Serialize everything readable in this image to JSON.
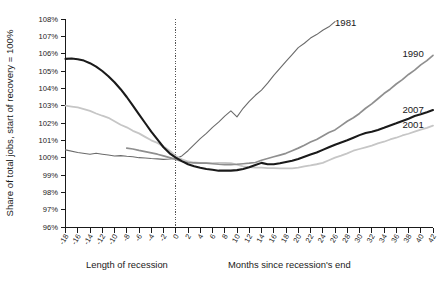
{
  "chart_data": {
    "type": "line",
    "title": "",
    "subtitle": "",
    "xlabel_left": "Length of recession",
    "xlabel_right": "Months since recession's end",
    "ylabel": "Share of total jobs, start of recovery = 100%",
    "grid": false,
    "legend_position": "inline-right",
    "xlim": [
      -18,
      42
    ],
    "ylim": [
      96,
      108
    ],
    "ytick_labels": [
      "108%",
      "107%",
      "106%",
      "105%",
      "104%",
      "103%",
      "102%",
      "101%",
      "100%",
      "99%",
      "98%",
      "97%",
      "96%"
    ],
    "ytick_values": [
      108,
      107,
      106,
      105,
      104,
      103,
      102,
      101,
      100,
      99,
      98,
      97,
      96
    ],
    "xtick_labels": [
      "-18",
      "-16",
      "-14",
      "-12",
      "-10",
      "-8",
      "-6",
      "-4",
      "-2",
      "0",
      "2",
      "4",
      "6",
      "8",
      "10",
      "12",
      "14",
      "16",
      "18",
      "20",
      "22",
      "24",
      "26",
      "28",
      "30",
      "32",
      "34",
      "36",
      "38",
      "40",
      "42"
    ],
    "xtick_values": [
      -18,
      -16,
      -14,
      -12,
      -10,
      -8,
      -6,
      -4,
      -2,
      0,
      2,
      4,
      6,
      8,
      10,
      12,
      14,
      16,
      18,
      20,
      22,
      24,
      26,
      28,
      30,
      32,
      34,
      36,
      38,
      40,
      42
    ],
    "reference_line_x": 0,
    "annotations": [
      {
        "name": "1981",
        "x": 26,
        "y": 107.6
      },
      {
        "name": "1990",
        "x": 37,
        "y": 105.8
      },
      {
        "name": "2007",
        "x": 37,
        "y": 102.6
      },
      {
        "name": "2001",
        "x": 37,
        "y": 101.7
      }
    ],
    "series": [
      {
        "name": "1981",
        "color": "#6b6b6b",
        "width": 1.1,
        "x": [
          -18,
          -16,
          -14,
          -13,
          -12,
          -11,
          -10,
          -9,
          -8,
          -7,
          -6,
          -5,
          -4,
          -3,
          -2,
          -1,
          0,
          1,
          2,
          3,
          4,
          5,
          6,
          7,
          8,
          9,
          10,
          11,
          12,
          13,
          14,
          15,
          16,
          17,
          18,
          19,
          20,
          21,
          22,
          23,
          24,
          25,
          26
        ],
        "values": [
          100.45,
          100.3,
          100.2,
          100.25,
          100.2,
          100.15,
          100.1,
          100.12,
          100.08,
          100.05,
          100.0,
          99.98,
          99.95,
          99.93,
          99.9,
          99.92,
          99.95,
          100.1,
          100.4,
          100.75,
          101.1,
          101.4,
          101.75,
          102.05,
          102.4,
          102.7,
          102.35,
          102.85,
          103.25,
          103.6,
          103.9,
          104.3,
          104.75,
          105.15,
          105.55,
          105.95,
          106.35,
          106.6,
          106.9,
          107.1,
          107.35,
          107.55,
          107.85
        ]
      },
      {
        "name": "1990",
        "color": "#8f8f8f",
        "width": 1.7,
        "x": [
          -8,
          -7,
          -6,
          -5,
          -4,
          -3,
          -2,
          -1,
          0,
          1,
          2,
          3,
          4,
          5,
          6,
          7,
          8,
          9,
          10,
          11,
          12,
          13,
          14,
          15,
          16,
          17,
          18,
          19,
          20,
          21,
          22,
          23,
          24,
          25,
          26,
          27,
          28,
          29,
          30,
          31,
          32,
          33,
          34,
          35,
          36,
          37,
          38,
          39,
          40,
          41,
          42
        ],
        "values": [
          100.55,
          100.5,
          100.42,
          100.35,
          100.28,
          100.2,
          100.1,
          100.0,
          99.9,
          99.78,
          99.72,
          99.7,
          99.68,
          99.68,
          99.65,
          99.62,
          99.6,
          99.6,
          99.62,
          99.65,
          99.68,
          99.72,
          99.85,
          99.95,
          100.05,
          100.15,
          100.25,
          100.4,
          100.55,
          100.72,
          100.9,
          101.05,
          101.25,
          101.45,
          101.6,
          101.85,
          102.1,
          102.3,
          102.55,
          102.85,
          103.1,
          103.4,
          103.7,
          103.95,
          104.25,
          104.5,
          104.8,
          105.05,
          105.35,
          105.6,
          105.9
        ]
      },
      {
        "name": "2007",
        "color": "#1a1a1a",
        "width": 2.1,
        "x": [
          -18,
          -17,
          -16,
          -15,
          -14,
          -13,
          -12,
          -11,
          -10,
          -9,
          -8,
          -7,
          -6,
          -5,
          -4,
          -3,
          -2,
          -1,
          0,
          1,
          2,
          3,
          4,
          5,
          6,
          7,
          8,
          9,
          10,
          11,
          12,
          13,
          14,
          15,
          16,
          17,
          18,
          19,
          20,
          21,
          22,
          23,
          24,
          25,
          26,
          27,
          28,
          29,
          30,
          31,
          32,
          33,
          34,
          35,
          36,
          37,
          38,
          39,
          40,
          41,
          42
        ],
        "values": [
          105.7,
          105.72,
          105.68,
          105.6,
          105.45,
          105.25,
          105.0,
          104.7,
          104.35,
          103.95,
          103.5,
          103.0,
          102.5,
          102.0,
          101.5,
          101.05,
          100.6,
          100.25,
          100.0,
          99.8,
          99.62,
          99.5,
          99.42,
          99.35,
          99.3,
          99.25,
          99.25,
          99.25,
          99.28,
          99.35,
          99.45,
          99.58,
          99.7,
          99.62,
          99.62,
          99.68,
          99.75,
          99.82,
          99.92,
          100.05,
          100.18,
          100.3,
          100.45,
          100.6,
          100.75,
          100.88,
          101.0,
          101.15,
          101.3,
          101.42,
          101.5,
          101.6,
          101.72,
          101.85,
          101.98,
          102.12,
          102.25,
          102.4,
          102.5,
          102.62,
          102.75
        ]
      },
      {
        "name": "2001",
        "color": "#c6c6c6",
        "width": 1.8,
        "x": [
          -18,
          -17,
          -16,
          -15,
          -14,
          -13,
          -12,
          -11,
          -10,
          -9,
          -8,
          -7,
          -6,
          -5,
          -4,
          -3,
          -2,
          -1,
          0,
          1,
          2,
          3,
          4,
          5,
          6,
          7,
          8,
          9,
          10,
          11,
          12,
          13,
          14,
          15,
          16,
          17,
          18,
          19,
          20,
          21,
          22,
          23,
          24,
          25,
          26,
          27,
          28,
          29,
          30,
          31,
          32,
          33,
          34,
          35,
          36,
          37,
          38,
          39,
          40,
          41,
          42
        ],
        "values": [
          103.0,
          102.95,
          102.9,
          102.8,
          102.7,
          102.55,
          102.42,
          102.3,
          102.1,
          101.9,
          101.75,
          101.55,
          101.4,
          101.2,
          101.0,
          100.85,
          100.65,
          100.4,
          100.1,
          99.9,
          99.78,
          99.72,
          99.7,
          99.68,
          99.68,
          99.7,
          99.7,
          99.68,
          99.6,
          99.5,
          99.45,
          99.42,
          99.42,
          99.4,
          99.4,
          99.38,
          99.38,
          99.38,
          99.42,
          99.5,
          99.55,
          99.62,
          99.7,
          99.85,
          100.0,
          100.12,
          100.25,
          100.4,
          100.5,
          100.6,
          100.7,
          100.82,
          100.92,
          101.05,
          101.15,
          101.28,
          101.38,
          101.5,
          101.62,
          101.72,
          101.85
        ]
      }
    ]
  }
}
